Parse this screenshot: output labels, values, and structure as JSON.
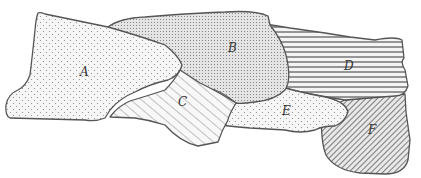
{
  "diagram": {
    "type": "region-map",
    "regions": [
      {
        "id": "A",
        "label": "A",
        "pattern": "sparse-dots"
      },
      {
        "id": "B",
        "label": "B",
        "pattern": "dense-dots"
      },
      {
        "id": "C",
        "label": "C",
        "pattern": "diagonal-lines-right"
      },
      {
        "id": "D",
        "label": "D",
        "pattern": "horizontal-lines"
      },
      {
        "id": "E",
        "label": "E",
        "pattern": "sparse-dots"
      },
      {
        "id": "F",
        "label": "F",
        "pattern": "dense-diagonal-lines"
      }
    ]
  }
}
